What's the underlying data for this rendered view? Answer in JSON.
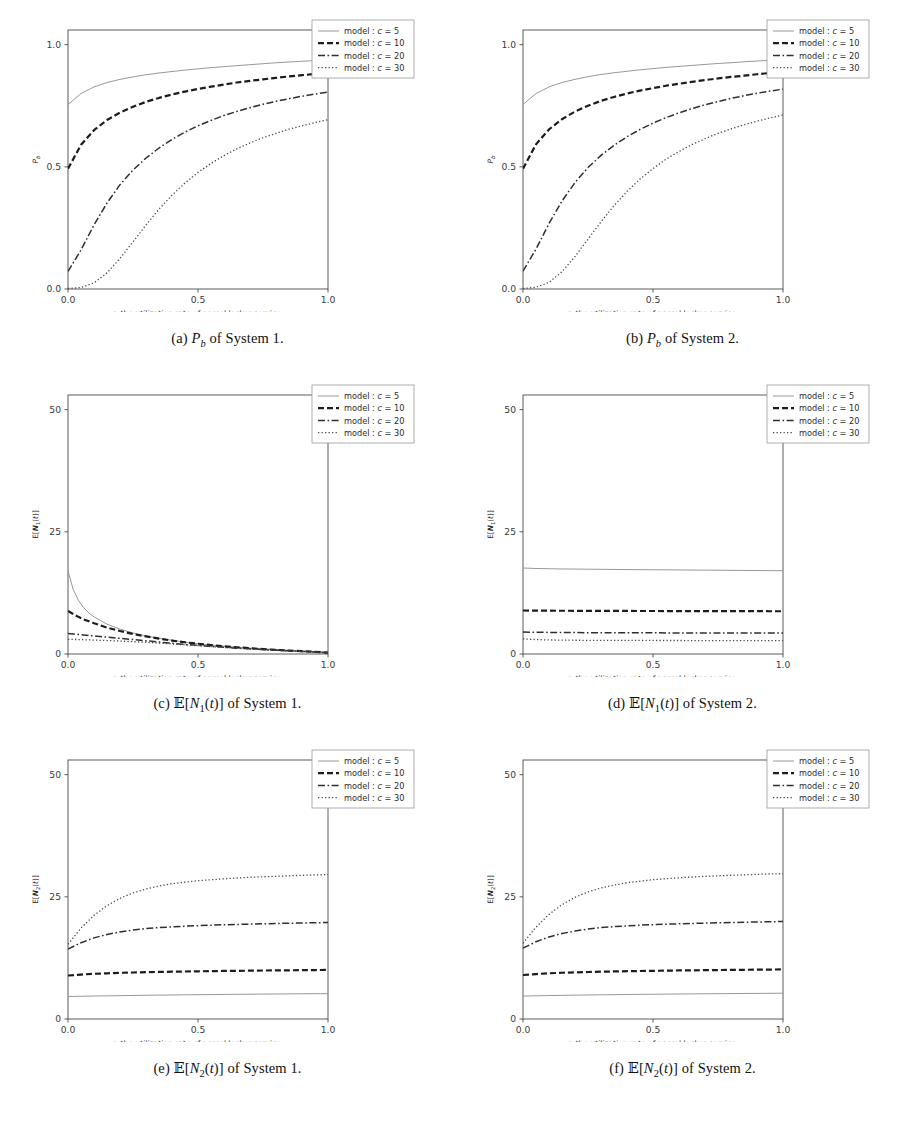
{
  "figure": {
    "width": 910,
    "height": 1131,
    "background": "#ffffff"
  },
  "legend": {
    "position": "outside-right",
    "entries": [
      {
        "label": "model : c = 5",
        "prefix": "model : ",
        "var": "c",
        "eq": " = ",
        "value": "5",
        "style": "solid",
        "color": "#8c8c8c",
        "width": 0.9,
        "dash": "none"
      },
      {
        "label": "model : c = 10",
        "prefix": "model : ",
        "var": "c",
        "eq": " = ",
        "value": "10",
        "style": "dashed",
        "color": "#1c1c1c",
        "width": 2.2,
        "dash": "6,3"
      },
      {
        "label": "model : c = 20",
        "prefix": "model : ",
        "var": "c",
        "eq": " = ",
        "value": "20",
        "style": "dashdot",
        "color": "#2f2f2f",
        "width": 1.5,
        "dash": "7,2.5,1.6,2.5"
      },
      {
        "label": "model : c = 30",
        "prefix": "model : ",
        "var": "c",
        "eq": " = ",
        "value": "30",
        "style": "dotted",
        "color": "#4a4a4a",
        "width": 1.3,
        "dash": "1.3,2.2"
      }
    ]
  },
  "axis": {
    "xlabel_pre": "r",
    "xlabel_post": ", the utilization rate of parcel locker service."
  },
  "captions": [
    {
      "tag": "(a)",
      "sym": "P",
      "sub": "b",
      "bb": false,
      "tail": " of System 1."
    },
    {
      "tag": "(b)",
      "sym": "P",
      "sub": "b",
      "bb": false,
      "tail": " of System 2."
    },
    {
      "tag": "(c)",
      "sym": "E",
      "sub": "1",
      "bb": true,
      "tail": " of System 1."
    },
    {
      "tag": "(d)",
      "sym": "E",
      "sub": "1",
      "bb": true,
      "tail": " of System 2."
    },
    {
      "tag": "(e)",
      "sym": "E",
      "sub": "2",
      "bb": true,
      "tail": " of System 1."
    },
    {
      "tag": "(f)",
      "sym": "E",
      "sub": "2",
      "bb": true,
      "tail": " of System 2."
    }
  ],
  "chart_data": [
    {
      "id": "a",
      "type": "line",
      "title": "(a) P_b of System 1.",
      "ylabel": "P_b",
      "xlabel": "r, the utilization rate of parcel locker service.",
      "xlim": [
        0.0,
        1.0
      ],
      "ylim": [
        0.0,
        1.06
      ],
      "xticks": [
        0.0,
        0.5,
        1.0
      ],
      "xticklabels": [
        "0.0",
        "0.5",
        "1.0"
      ],
      "yticks": [
        0.0,
        0.5,
        1.0
      ],
      "yticklabels": [
        "0.0",
        "0.5",
        "1.0"
      ],
      "grid": false,
      "x": [
        0.0,
        0.05,
        0.1,
        0.15,
        0.2,
        0.25,
        0.3,
        0.35,
        0.4,
        0.45,
        0.5,
        0.55,
        0.6,
        0.65,
        0.7,
        0.75,
        0.8,
        0.85,
        0.9,
        0.95,
        1.0
      ],
      "series": [
        {
          "name": "model : c = 5",
          "values": [
            0.755,
            0.8,
            0.827,
            0.845,
            0.858,
            0.868,
            0.877,
            0.884,
            0.89,
            0.896,
            0.901,
            0.906,
            0.91,
            0.914,
            0.918,
            0.922,
            0.926,
            0.929,
            0.932,
            0.935,
            0.938
          ]
        },
        {
          "name": "model : c = 10",
          "values": [
            0.492,
            0.59,
            0.65,
            0.692,
            0.722,
            0.746,
            0.766,
            0.782,
            0.796,
            0.808,
            0.819,
            0.828,
            0.837,
            0.845,
            0.852,
            0.858,
            0.864,
            0.87,
            0.875,
            0.88,
            0.885
          ]
        },
        {
          "name": "model : c = 20",
          "values": [
            0.072,
            0.16,
            0.262,
            0.352,
            0.427,
            0.487,
            0.536,
            0.577,
            0.612,
            0.642,
            0.668,
            0.69,
            0.71,
            0.727,
            0.742,
            0.756,
            0.768,
            0.779,
            0.789,
            0.798,
            0.806
          ]
        },
        {
          "name": "model : c = 30",
          "values": [
            0.002,
            0.006,
            0.025,
            0.066,
            0.125,
            0.193,
            0.262,
            0.327,
            0.384,
            0.434,
            0.477,
            0.514,
            0.546,
            0.574,
            0.598,
            0.619,
            0.637,
            0.654,
            0.668,
            0.681,
            0.693
          ]
        }
      ]
    },
    {
      "id": "b",
      "type": "line",
      "title": "(b) P_b of System 2.",
      "ylabel": "P_b",
      "xlabel": "r, the utilization rate of parcel locker service.",
      "xlim": [
        0.0,
        1.0
      ],
      "ylim": [
        0.0,
        1.06
      ],
      "xticks": [
        0.0,
        0.5,
        1.0
      ],
      "xticklabels": [
        "0.0",
        "0.5",
        "1.0"
      ],
      "yticks": [
        0.0,
        0.5,
        1.0
      ],
      "yticklabels": [
        "0.0",
        "0.5",
        "1.0"
      ],
      "grid": false,
      "x": [
        0.0,
        0.05,
        0.1,
        0.15,
        0.2,
        0.25,
        0.3,
        0.35,
        0.4,
        0.45,
        0.5,
        0.55,
        0.6,
        0.65,
        0.7,
        0.75,
        0.8,
        0.85,
        0.9,
        0.95,
        1.0
      ],
      "series": [
        {
          "name": "model : c = 5",
          "values": [
            0.755,
            0.8,
            0.827,
            0.845,
            0.858,
            0.869,
            0.878,
            0.885,
            0.891,
            0.897,
            0.902,
            0.907,
            0.911,
            0.915,
            0.919,
            0.923,
            0.926,
            0.93,
            0.933,
            0.936,
            0.939
          ]
        },
        {
          "name": "model : c = 10",
          "values": [
            0.492,
            0.592,
            0.653,
            0.695,
            0.726,
            0.75,
            0.77,
            0.786,
            0.8,
            0.812,
            0.822,
            0.832,
            0.84,
            0.848,
            0.855,
            0.862,
            0.868,
            0.873,
            0.879,
            0.884,
            0.888
          ]
        },
        {
          "name": "model : c = 20",
          "values": [
            0.073,
            0.163,
            0.268,
            0.36,
            0.436,
            0.497,
            0.547,
            0.588,
            0.623,
            0.653,
            0.679,
            0.701,
            0.721,
            0.738,
            0.754,
            0.767,
            0.78,
            0.791,
            0.801,
            0.81,
            0.818
          ]
        },
        {
          "name": "model : c = 30",
          "values": [
            0.002,
            0.007,
            0.027,
            0.071,
            0.133,
            0.204,
            0.275,
            0.341,
            0.399,
            0.45,
            0.493,
            0.531,
            0.563,
            0.591,
            0.615,
            0.637,
            0.655,
            0.672,
            0.687,
            0.7,
            0.712
          ]
        }
      ]
    },
    {
      "id": "c",
      "type": "line",
      "title": "(c) E[N_1(t)] of System 1.",
      "ylabel": "E[N_1(t)]",
      "xlabel": "r, the utilization rate of parcel locker service.",
      "xlim": [
        0.0,
        1.0
      ],
      "ylim": [
        0.0,
        53.0
      ],
      "xticks": [
        0.0,
        0.5,
        1.0
      ],
      "xticklabels": [
        "0.0",
        "0.5",
        "1.0"
      ],
      "yticks": [
        0,
        25,
        50
      ],
      "yticklabels": [
        "0",
        "25",
        "50"
      ],
      "grid": false,
      "x": [
        0.0,
        0.02,
        0.04,
        0.06,
        0.08,
        0.1,
        0.15,
        0.2,
        0.25,
        0.3,
        0.35,
        0.4,
        0.45,
        0.5,
        0.55,
        0.6,
        0.65,
        0.7,
        0.75,
        0.8,
        0.85,
        0.9,
        0.95,
        1.0
      ],
      "series": [
        {
          "name": "model : c = 5",
          "values": [
            17.0,
            13.2,
            11.0,
            9.5,
            8.4,
            7.6,
            6.1,
            5.1,
            4.3,
            3.7,
            3.2,
            2.8,
            2.4,
            2.1,
            1.85,
            1.6,
            1.4,
            1.2,
            1.05,
            0.9,
            0.75,
            0.6,
            0.45,
            0.3
          ]
        },
        {
          "name": "model : c = 10",
          "values": [
            8.8,
            8.2,
            7.6,
            7.1,
            6.7,
            6.3,
            5.4,
            4.7,
            4.1,
            3.6,
            3.15,
            2.75,
            2.4,
            2.1,
            1.82,
            1.58,
            1.37,
            1.18,
            1.0,
            0.85,
            0.7,
            0.57,
            0.43,
            0.3
          ]
        },
        {
          "name": "model : c = 20",
          "values": [
            4.2,
            4.1,
            4.0,
            3.9,
            3.8,
            3.7,
            3.45,
            3.2,
            2.95,
            2.7,
            2.45,
            2.2,
            1.95,
            1.75,
            1.55,
            1.38,
            1.2,
            1.05,
            0.9,
            0.77,
            0.64,
            0.52,
            0.4,
            0.28
          ]
        },
        {
          "name": "model : c = 30",
          "values": [
            3.0,
            2.98,
            2.95,
            2.92,
            2.88,
            2.85,
            2.75,
            2.65,
            2.52,
            2.38,
            2.22,
            2.05,
            1.88,
            1.7,
            1.52,
            1.35,
            1.18,
            1.03,
            0.88,
            0.75,
            0.62,
            0.5,
            0.39,
            0.27
          ]
        }
      ]
    },
    {
      "id": "d",
      "type": "line",
      "title": "(d) E[N_1(t)] of System 2.",
      "ylabel": "E[N_1(t)]",
      "xlabel": "r, the utilization rate of parcel locker service.",
      "xlim": [
        0.0,
        1.0
      ],
      "ylim": [
        0.0,
        53.0
      ],
      "xticks": [
        0.0,
        0.5,
        1.0
      ],
      "xticklabels": [
        "0.0",
        "0.5",
        "1.0"
      ],
      "yticks": [
        0,
        25,
        50
      ],
      "yticklabels": [
        "0",
        "25",
        "50"
      ],
      "grid": false,
      "x": [
        0.0,
        0.05,
        0.1,
        0.15,
        0.2,
        0.25,
        0.3,
        0.35,
        0.4,
        0.45,
        0.5,
        0.55,
        0.6,
        0.65,
        0.7,
        0.75,
        0.8,
        0.85,
        0.9,
        0.95,
        1.0
      ],
      "series": [
        {
          "name": "model : c = 5",
          "values": [
            17.6,
            17.5,
            17.45,
            17.4,
            17.38,
            17.35,
            17.33,
            17.3,
            17.28,
            17.26,
            17.24,
            17.22,
            17.2,
            17.18,
            17.16,
            17.14,
            17.12,
            17.1,
            17.08,
            17.06,
            17.05
          ]
        },
        {
          "name": "model : c = 10",
          "values": [
            8.9,
            8.88,
            8.86,
            8.85,
            8.84,
            8.83,
            8.82,
            8.82,
            8.81,
            8.8,
            8.8,
            8.79,
            8.79,
            8.78,
            8.78,
            8.77,
            8.77,
            8.76,
            8.76,
            8.75,
            8.75
          ]
        },
        {
          "name": "model : c = 20",
          "values": [
            4.5,
            4.45,
            4.42,
            4.4,
            4.38,
            4.37,
            4.36,
            4.35,
            4.34,
            4.33,
            4.33,
            4.32,
            4.32,
            4.31,
            4.31,
            4.3,
            4.3,
            4.29,
            4.29,
            4.28,
            4.28
          ]
        },
        {
          "name": "model : c = 30",
          "values": [
            3.1,
            2.95,
            2.88,
            2.84,
            2.82,
            2.8,
            2.79,
            2.78,
            2.78,
            2.77,
            2.77,
            2.76,
            2.76,
            2.75,
            2.75,
            2.75,
            2.74,
            2.74,
            2.73,
            2.73,
            2.72
          ]
        }
      ]
    },
    {
      "id": "e",
      "type": "line",
      "title": "(e) E[N_2(t)] of System 1.",
      "ylabel": "E[N_2(t)]",
      "xlabel": "r, the utilization rate of parcel locker service.",
      "xlim": [
        0.0,
        1.0
      ],
      "ylim": [
        0.0,
        53.0
      ],
      "xticks": [
        0.0,
        0.5,
        1.0
      ],
      "xticklabels": [
        "0.0",
        "0.5",
        "1.0"
      ],
      "yticks": [
        0,
        25,
        50
      ],
      "yticklabels": [
        "0",
        "25",
        "50"
      ],
      "grid": false,
      "x": [
        0.0,
        0.05,
        0.1,
        0.15,
        0.2,
        0.25,
        0.3,
        0.35,
        0.4,
        0.45,
        0.5,
        0.55,
        0.6,
        0.65,
        0.7,
        0.75,
        0.8,
        0.85,
        0.9,
        0.95,
        1.0
      ],
      "series": [
        {
          "name": "model : c = 5",
          "values": [
            4.6,
            4.65,
            4.7,
            4.74,
            4.78,
            4.82,
            4.86,
            4.89,
            4.92,
            4.95,
            4.98,
            5.0,
            5.03,
            5.05,
            5.07,
            5.1,
            5.12,
            5.14,
            5.16,
            5.18,
            5.2
          ]
        },
        {
          "name": "model : c = 10",
          "values": [
            8.9,
            9.1,
            9.25,
            9.35,
            9.45,
            9.52,
            9.58,
            9.63,
            9.68,
            9.72,
            9.76,
            9.8,
            9.83,
            9.86,
            9.89,
            9.92,
            9.95,
            9.97,
            10.0,
            10.02,
            10.05
          ]
        },
        {
          "name": "model : c = 20",
          "values": [
            14.3,
            15.6,
            16.6,
            17.3,
            17.8,
            18.2,
            18.5,
            18.7,
            18.85,
            19.0,
            19.1,
            19.2,
            19.28,
            19.35,
            19.42,
            19.48,
            19.54,
            19.6,
            19.65,
            19.7,
            19.75
          ]
        },
        {
          "name": "model : c = 30",
          "values": [
            15.3,
            18.6,
            21.2,
            23.2,
            24.7,
            25.8,
            26.6,
            27.2,
            27.7,
            28.0,
            28.3,
            28.5,
            28.7,
            28.85,
            29.0,
            29.1,
            29.2,
            29.3,
            29.4,
            29.48,
            29.55
          ]
        }
      ]
    },
    {
      "id": "f",
      "type": "line",
      "title": "(f) E[N_2(t)] of System 2.",
      "ylabel": "E[N_2(t)]",
      "xlabel": "r, the utilization rate of parcel locker service.",
      "xlim": [
        0.0,
        1.0
      ],
      "ylim": [
        0.0,
        53.0
      ],
      "xticks": [
        0.0,
        0.5,
        1.0
      ],
      "xticklabels": [
        "0.0",
        "0.5",
        "1.0"
      ],
      "yticks": [
        0,
        25,
        50
      ],
      "yticklabels": [
        "0",
        "25",
        "50"
      ],
      "grid": false,
      "x": [
        0.0,
        0.05,
        0.1,
        0.15,
        0.2,
        0.25,
        0.3,
        0.35,
        0.4,
        0.45,
        0.5,
        0.55,
        0.6,
        0.65,
        0.7,
        0.75,
        0.8,
        0.85,
        0.9,
        0.95,
        1.0
      ],
      "series": [
        {
          "name": "model : c = 5",
          "values": [
            4.7,
            4.75,
            4.8,
            4.84,
            4.88,
            4.92,
            4.95,
            4.98,
            5.01,
            5.04,
            5.07,
            5.09,
            5.12,
            5.14,
            5.16,
            5.18,
            5.2,
            5.22,
            5.24,
            5.26,
            5.28
          ]
        },
        {
          "name": "model : c = 10",
          "values": [
            9.0,
            9.2,
            9.35,
            9.46,
            9.55,
            9.62,
            9.68,
            9.73,
            9.78,
            9.82,
            9.86,
            9.9,
            9.93,
            9.96,
            9.99,
            10.02,
            10.05,
            10.07,
            10.1,
            10.12,
            10.15
          ]
        },
        {
          "name": "model : c = 20",
          "values": [
            14.5,
            15.8,
            16.8,
            17.5,
            18.0,
            18.4,
            18.7,
            18.9,
            19.05,
            19.2,
            19.3,
            19.4,
            19.48,
            19.55,
            19.62,
            19.68,
            19.74,
            19.8,
            19.85,
            19.9,
            19.95
          ]
        },
        {
          "name": "model : c = 30",
          "values": [
            15.5,
            18.8,
            21.4,
            23.4,
            24.9,
            26.0,
            26.8,
            27.4,
            27.9,
            28.2,
            28.5,
            28.7,
            28.9,
            29.05,
            29.2,
            29.3,
            29.4,
            29.5,
            29.6,
            29.68,
            29.75
          ]
        }
      ]
    }
  ],
  "layout": {
    "panel_height": 377,
    "plot_box": {
      "x": 68,
      "y": 18,
      "w": 260,
      "h": 259
    },
    "legend_box": {
      "x": 312,
      "y": 8,
      "w": 102,
      "h": 58
    }
  }
}
